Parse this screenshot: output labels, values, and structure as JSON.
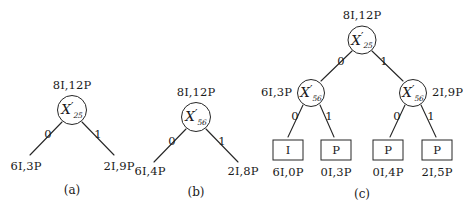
{
  "figure": {
    "background": "#ffffff",
    "stroke": "#262626",
    "panels": [
      {
        "id": "a",
        "caption": "(a)",
        "root": {
          "label_top": "8I,12P",
          "symbol": "X",
          "prime": "′",
          "subscript": "25"
        },
        "edges": [
          {
            "bit": "0",
            "leaf_label": "6I,3P"
          },
          {
            "bit": "1",
            "leaf_label": "2I,9P"
          }
        ]
      },
      {
        "id": "b",
        "caption": "(b)",
        "root": {
          "label_top": "8I,12P",
          "symbol": "X",
          "prime": "′",
          "subscript": "56"
        },
        "edges": [
          {
            "bit": "0",
            "leaf_label": "6I,4P"
          },
          {
            "bit": "1",
            "leaf_label": "2I,8P"
          }
        ]
      },
      {
        "id": "c",
        "caption": "(c)",
        "root": {
          "label_top": "8I,12P",
          "symbol": "X",
          "prime": "′",
          "subscript": "25"
        },
        "root_edges": [
          {
            "bit": "0"
          },
          {
            "bit": "1"
          }
        ],
        "internal": [
          {
            "symbol": "X",
            "prime": "′",
            "subscript": "56",
            "side_label": "6I,3P",
            "side": "left",
            "edges": [
              {
                "bit": "0"
              },
              {
                "bit": "1"
              }
            ]
          },
          {
            "symbol": "X",
            "prime": "′",
            "subscript": "56",
            "side_label": "2I,9P",
            "side": "right",
            "edges": [
              {
                "bit": "0"
              },
              {
                "bit": "1"
              }
            ]
          }
        ],
        "leaves": [
          {
            "box_text": "I",
            "label": "6I,0P"
          },
          {
            "box_text": "P",
            "label": "0I,3P"
          },
          {
            "box_text": "P",
            "label": "0I,4P"
          },
          {
            "box_text": "P",
            "label": "2I,5P"
          }
        ]
      }
    ]
  }
}
